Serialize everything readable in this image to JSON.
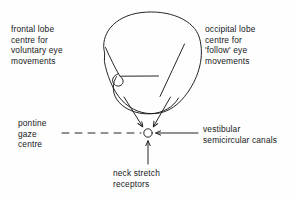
{
  "figure": {
    "background_color": "#fefefe",
    "ink_color": "#1a1a1a"
  },
  "labels": {
    "frontal_lobe": {
      "name": "frontal-lobe-label",
      "lines": [
        "frontal lobe",
        "centre for",
        "voluntary eye",
        "movements"
      ]
    },
    "occipital_lobe": {
      "name": "occipital-lobe-label",
      "lines": [
        "occipital lobe",
        "centre for",
        "'follow' eye",
        "movements"
      ]
    },
    "pontine_gaze": {
      "name": "pontine-gaze-centre-label",
      "lines": [
        "pontine",
        "gaze",
        "centre"
      ]
    },
    "vestibular": {
      "name": "vestibular-label",
      "lines": [
        "vestibular",
        "semicircular canals"
      ]
    },
    "neck_stretch": {
      "name": "neck-stretch-receptors-label",
      "lines": [
        "neck stretch",
        "receptors"
      ]
    }
  },
  "diagram": {
    "node": {
      "name": "pontine-gaze-centre-node",
      "shape": "small-open-circle",
      "cx": 148,
      "cy": 133,
      "r": 4.2
    },
    "connectors": [
      {
        "name": "frontal-to-node-arrow",
        "style": "solid",
        "arrow": true,
        "from": "frontal lobe cortex",
        "to": "pontine gaze centre"
      },
      {
        "name": "occipital-to-node-arrow",
        "style": "solid",
        "arrow": true,
        "from": "occipital lobe cortex",
        "to": "pontine gaze centre"
      },
      {
        "name": "pontine-dashed-leader",
        "style": "dashed",
        "arrow": false,
        "from": "pontine gaze centre label",
        "to": "pontine gaze centre"
      },
      {
        "name": "vestibular-to-node-arrow",
        "style": "solid",
        "arrow": true,
        "from": "vestibular semicircular canals",
        "to": "pontine gaze centre"
      },
      {
        "name": "neck-stretch-to-node-arrow",
        "style": "solid",
        "arrow": true,
        "from": "neck stretch receptors",
        "to": "pontine gaze centre"
      }
    ],
    "outlines": [
      {
        "name": "brain-outline",
        "description": "hand-drawn cerebral hemisphere outline"
      },
      {
        "name": "brainstem-outline",
        "description": "brainstem / pons region at base of brain"
      },
      {
        "name": "cortex-fold-line-left",
        "description": "internal fold line on left of brain"
      },
      {
        "name": "cortex-fold-line-right",
        "description": "internal fold line on right of brain"
      },
      {
        "name": "horizontal-fissure-line",
        "description": "short horizontal line across the brainstem"
      }
    ]
  }
}
